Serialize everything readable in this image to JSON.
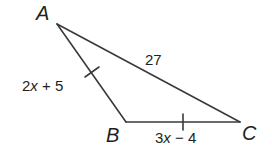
{
  "figure": {
    "type": "triangle",
    "vertices": [
      {
        "name": "A",
        "x": 57,
        "y": 24
      },
      {
        "name": "B",
        "x": 126,
        "y": 122
      },
      {
        "name": "C",
        "x": 240,
        "y": 122
      }
    ],
    "sides": {
      "AB": {
        "label": "2x + 5",
        "label_var": "x",
        "label_pre": "2",
        "label_post": " + 5",
        "tick": true
      },
      "BC": {
        "label": "3x − 4",
        "label_var": "x",
        "label_pre": "3",
        "label_post": " − 4",
        "tick": true
      },
      "AC": {
        "label": "27",
        "tick": false
      }
    },
    "vertex_labels": {
      "A": "A",
      "B": "B",
      "C": "C"
    },
    "colors": {
      "stroke": "#3a3a3a",
      "text": "#231f20",
      "background": "#ffffff"
    }
  }
}
